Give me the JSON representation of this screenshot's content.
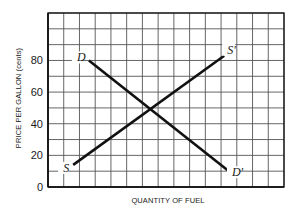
{
  "chart_data": {
    "type": "line",
    "title": "",
    "xlabel": "QUANTITY OF FUEL",
    "ylabel": "PRICE PER GALLON (cents)",
    "xlim": [
      0,
      15
    ],
    "ylim": [
      0,
      110
    ],
    "grid": true,
    "grid_columns": 15,
    "grid_rows": 11,
    "y_ticks": [
      0,
      20,
      40,
      60,
      80
    ],
    "x_ticks": [],
    "legend": "none",
    "series": [
      {
        "name": "Demand",
        "start_label": "D",
        "end_label": "D'",
        "x": [
          2.6,
          11.5
        ],
        "values": [
          80,
          10
        ]
      },
      {
        "name": "Supply",
        "start_label": "S",
        "end_label": "S'",
        "x": [
          1.6,
          11.2
        ],
        "values": [
          14,
          83
        ]
      }
    ],
    "annotations": [
      {
        "text": "equilibrium (intersection)",
        "x": 6.5,
        "y": 50
      }
    ]
  },
  "style": {
    "line_color": "#111111",
    "grid_color": "#555555",
    "axis_color": "#111111"
  }
}
